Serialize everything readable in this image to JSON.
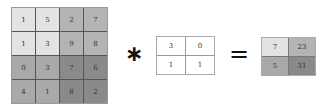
{
  "input_matrix": {
    "rows": [
      [
        "1",
        "5",
        "2",
        "7"
      ],
      [
        "1",
        "3",
        "9",
        "8"
      ],
      [
        "0",
        "3",
        "7",
        "6"
      ],
      [
        "4",
        "1",
        "8",
        "2"
      ]
    ],
    "colors": [
      [
        "#e3e3e3",
        "#e3e3e3",
        "#b4b4b4",
        "#b4b4b4"
      ],
      [
        "#e3e3e3",
        "#e3e3e3",
        "#b4b4b4",
        "#b4b4b4"
      ],
      [
        "#a9a9a9",
        "#a9a9a9",
        "#8a8a8a",
        "#8a8a8a"
      ],
      [
        "#a9a9a9",
        "#a9a9a9",
        "#8a8a8a",
        "#8a8a8a"
      ]
    ]
  },
  "operator_convolve": "∗",
  "kernel": {
    "rows": [
      [
        "3",
        "0"
      ],
      [
        "1",
        "1"
      ]
    ],
    "color": "#ffffff"
  },
  "operator_equals": "=",
  "output_matrix": {
    "rows": [
      [
        "7",
        "23"
      ],
      [
        "5",
        "31"
      ]
    ],
    "colors": [
      [
        "#e3e3e3",
        "#b4b4b4"
      ],
      [
        "#a9a9a9",
        "#8a8a8a"
      ]
    ]
  }
}
